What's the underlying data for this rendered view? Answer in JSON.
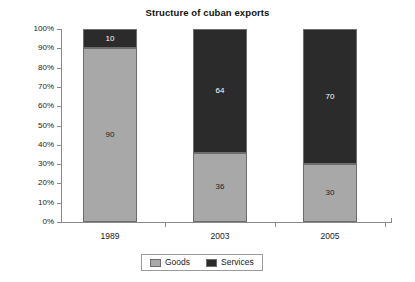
{
  "chart_data": {
    "type": "bar",
    "subtype": "stacked-percentage",
    "title": "Structure of cuban exports",
    "xlabel": "",
    "ylabel": "",
    "categories": [
      "1989",
      "2003",
      "2005"
    ],
    "series": [
      {
        "name": "Goods",
        "values": [
          90,
          36,
          30
        ],
        "color": "#a8a8a8"
      },
      {
        "name": "Services",
        "values": [
          10,
          64,
          70
        ],
        "color": "#2b2b2b"
      }
    ],
    "ylim": [
      0,
      100
    ],
    "ytick_labels": [
      "100%",
      "90%",
      "80%",
      "70%",
      "60%",
      "50%",
      "40%",
      "30%",
      "20%",
      "10%",
      "0%"
    ],
    "ytick_values": [
      100,
      90,
      80,
      70,
      60,
      50,
      40,
      30,
      20,
      10,
      0
    ],
    "grid": false,
    "legend_position": "bottom"
  },
  "legend": {
    "entries": [
      {
        "label": "Goods"
      },
      {
        "label": "Services"
      }
    ]
  },
  "bars": [
    {
      "category": "1989",
      "goods_label": "90",
      "services_label": "10"
    },
    {
      "category": "2003",
      "goods_label": "36",
      "services_label": "64"
    },
    {
      "category": "2005",
      "goods_label": "30",
      "services_label": "70"
    }
  ]
}
